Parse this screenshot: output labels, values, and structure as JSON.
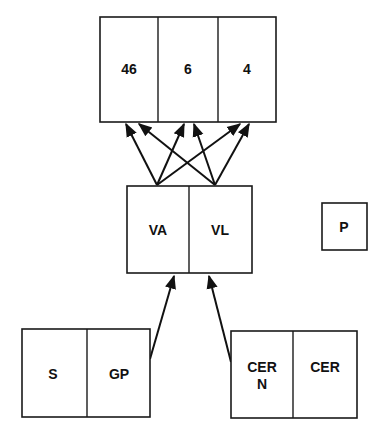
{
  "diagram": {
    "top_box": {
      "cells": [
        {
          "label": "46"
        },
        {
          "label": "6"
        },
        {
          "label": "4"
        }
      ]
    },
    "middle_box": {
      "cells": [
        {
          "label": "VA"
        },
        {
          "label": "VL"
        }
      ]
    },
    "isolated_box": {
      "label": "P"
    },
    "bottom_left_box": {
      "cells": [
        {
          "label": "S"
        },
        {
          "label": "GP"
        }
      ]
    },
    "bottom_right_box": {
      "cells": [
        {
          "label_line1": "CER",
          "label_line2": "N"
        },
        {
          "label": "CER"
        }
      ]
    },
    "connections": [
      {
        "from": "VA",
        "to": "46"
      },
      {
        "from": "VA",
        "to": "6"
      },
      {
        "from": "VA",
        "to": "4"
      },
      {
        "from": "VL",
        "to": "46"
      },
      {
        "from": "VL",
        "to": "6"
      },
      {
        "from": "VL",
        "to": "4"
      },
      {
        "from": "GP",
        "to": "VA"
      },
      {
        "from": "CER N",
        "to": "VL"
      }
    ],
    "colors": {
      "stroke": "#1a1a1a",
      "background": "#ffffff"
    }
  }
}
